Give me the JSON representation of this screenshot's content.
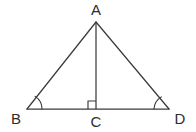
{
  "figure": {
    "type": "geometry-diagram",
    "shape_name": "isosceles-triangle-with-altitude",
    "background_color": "#ffffff",
    "stroke_color": "#3b3b3b",
    "label_color": "#2e2e2e",
    "vertices": {
      "A": {
        "label": "A",
        "x": 96,
        "y": 22,
        "label_x": 96,
        "label_y": 15
      },
      "B": {
        "label": "B",
        "x": 27,
        "y": 109,
        "label_x": 16,
        "label_y": 124
      },
      "C": {
        "label": "C",
        "x": 96,
        "y": 109,
        "label_x": 96,
        "label_y": 127
      },
      "D": {
        "label": "D",
        "x": 169,
        "y": 109,
        "label_x": 180,
        "label_y": 124
      }
    },
    "segments": [
      {
        "name": "side-AB",
        "from": "B",
        "to": "A"
      },
      {
        "name": "side-AD",
        "from": "A",
        "to": "D"
      },
      {
        "name": "base-BD",
        "from": "B",
        "to": "D"
      },
      {
        "name": "altitude-AC",
        "from": "A",
        "to": "C"
      }
    ],
    "angle_marks": [
      {
        "name": "angle-arc-B",
        "vertex": "B",
        "radius": 15
      },
      {
        "name": "angle-arc-D",
        "vertex": "D",
        "radius": 15
      }
    ],
    "right_angle": {
      "name": "right-angle-at-C",
      "vertex": "C",
      "size": 8,
      "orientation": "upper-left"
    }
  }
}
